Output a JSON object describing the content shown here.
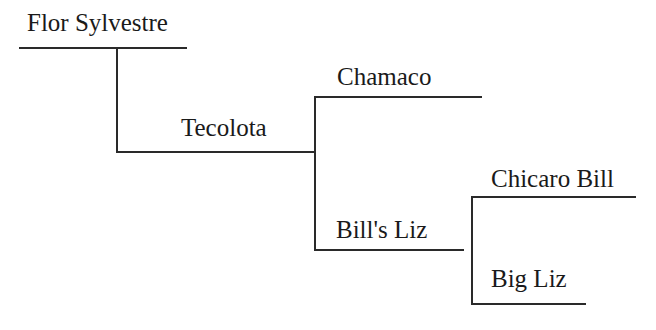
{
  "pedigree": {
    "root": {
      "name": "Flor Sylvestre"
    },
    "dam": {
      "name": "Tecolota"
    },
    "dam_sire": {
      "name": "Chamaco"
    },
    "dam_dam": {
      "name": "Bill's Liz"
    },
    "dam_dam_sire": {
      "name": "Chicaro Bill"
    },
    "dam_dam_dam": {
      "name": "Big Liz"
    }
  }
}
